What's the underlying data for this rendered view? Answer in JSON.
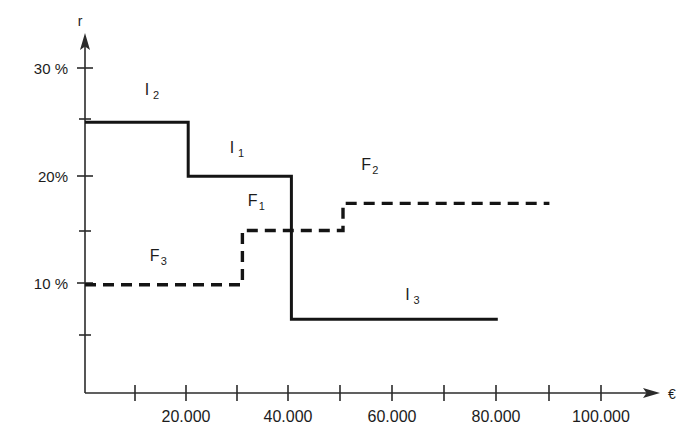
{
  "chart_data": {
    "type": "line",
    "title": "",
    "xlabel": "€",
    "ylabel": "r",
    "xlim": [
      0,
      110000
    ],
    "ylim": [
      0,
      32
    ],
    "grid": false,
    "legend": "inline-annotations",
    "x_ticks": [
      10000,
      20000,
      30000,
      40000,
      50000,
      60000,
      70000,
      80000,
      90000,
      100000
    ],
    "x_tick_labels": [
      "",
      "20.000",
      "",
      "40.000",
      "",
      "60.000",
      "",
      "80.000",
      "",
      "100.000"
    ],
    "y_ticks": [
      5,
      10,
      15,
      20,
      25,
      30
    ],
    "y_tick_labels": [
      "",
      "10 %",
      "",
      "20%",
      "",
      "30 %"
    ],
    "series": [
      {
        "name": "I",
        "style": "solid",
        "label_positions": [
          {
            "label": "I",
            "sub": "2",
            "x": 12000,
            "y": 27.5
          },
          {
            "label": "I",
            "sub": "1",
            "x": 28500,
            "y": 22.2
          },
          {
            "label": "I",
            "sub": "3",
            "x": 62500,
            "y": 8.6
          }
        ],
        "steps": [
          {
            "x_start": 0,
            "x_end": 20000,
            "value": 25,
            "segment": "I2"
          },
          {
            "x_start": 20000,
            "x_end": 40000,
            "value": 20,
            "segment": "I1"
          },
          {
            "x_start": 40000,
            "x_end": 80000,
            "value": 6.8,
            "segment": "I3"
          }
        ]
      },
      {
        "name": "F",
        "style": "dashed",
        "label_positions": [
          {
            "label": "F",
            "sub": "3",
            "x": 13500,
            "y": 12.2
          },
          {
            "label": "F",
            "sub": "1",
            "x": 32500,
            "y": 17.3
          },
          {
            "label": "F",
            "sub": "2",
            "x": 54500,
            "y": 20.6
          }
        ],
        "steps": [
          {
            "x_start": 0,
            "x_end": 30500,
            "value": 10,
            "segment": "F3"
          },
          {
            "x_start": 30500,
            "x_end": 50000,
            "value": 15,
            "segment": "F1"
          },
          {
            "x_start": 50000,
            "x_end": 90000,
            "value": 17.5,
            "segment": "F2"
          }
        ]
      }
    ]
  },
  "axes": {
    "y_axis_name": "r",
    "x_axis_name": "€",
    "y_labels": [
      {
        "text": "30 %",
        "value": 30
      },
      {
        "text": "20%",
        "value": 20
      },
      {
        "text": "10 %",
        "value": 10
      }
    ],
    "x_labels": [
      {
        "text": "20.000",
        "value": 20000
      },
      {
        "text": "40.000",
        "value": 40000
      },
      {
        "text": "60.000",
        "value": 60000
      },
      {
        "text": "80.000",
        "value": 80000
      },
      {
        "text": "100.000",
        "value": 100000
      }
    ]
  },
  "annotations": {
    "i2": {
      "label": "I",
      "sub": "2"
    },
    "i1": {
      "label": "I",
      "sub": "1"
    },
    "i3": {
      "label": "I",
      "sub": "3"
    },
    "f3": {
      "label": "F",
      "sub": "3"
    },
    "f1": {
      "label": "F",
      "sub": "1"
    },
    "f2": {
      "label": "F",
      "sub": "2"
    }
  },
  "colors": {
    "line": "#141414",
    "axis": "#2b2b2b",
    "background": "#ffffff"
  }
}
